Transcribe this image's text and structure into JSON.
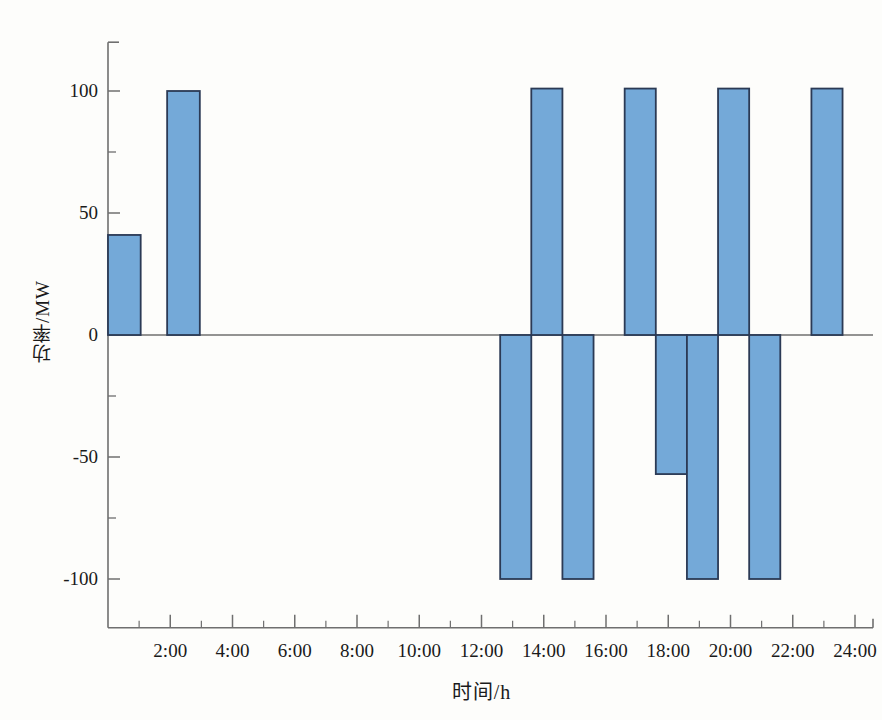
{
  "chart_data": {
    "type": "bar",
    "title": "",
    "xlabel": "时间/h",
    "ylabel": "功率/MW",
    "xlim": [
      0,
      24
    ],
    "ylim": [
      -120,
      120
    ],
    "grid": false,
    "legend": null,
    "x_tick_labels": [
      "2:00",
      "4:00",
      "6:00",
      "8:00",
      "10:00",
      "12:00",
      "14:00",
      "16:00",
      "18:00",
      "20:00",
      "22:00",
      "24:00"
    ],
    "x_tick_values": [
      2,
      4,
      6,
      8,
      10,
      12,
      14,
      16,
      18,
      20,
      22,
      24
    ],
    "x_minor_tick_step": 1,
    "y_tick_labels": [
      "100",
      "50",
      "0",
      "-50",
      "-100"
    ],
    "y_tick_values": [
      100,
      50,
      0,
      -50,
      -100
    ],
    "y_minor_tick_values": [
      75,
      25,
      -25,
      -75
    ],
    "bar_fill_color": "#74a9d8",
    "bar_edge_color": "#2b3a55",
    "axis_color": "#6f6f6f",
    "bars": [
      {
        "label": "0:00-1:00",
        "x_start": 0,
        "x_end": 1.05,
        "value": 41
      },
      {
        "label": "2:00-3:00",
        "x_start": 1.9,
        "x_end": 2.95,
        "value": 100
      },
      {
        "label": "13:00-14:00",
        "x_start": 12.6,
        "x_end": 13.6,
        "value": -100
      },
      {
        "label": "14:00-15:00",
        "x_start": 13.6,
        "x_end": 14.6,
        "value": 101
      },
      {
        "label": "15:00-16:00",
        "x_start": 14.6,
        "x_end": 15.6,
        "value": -100
      },
      {
        "label": "17:00-18:00",
        "x_start": 16.6,
        "x_end": 17.6,
        "value": 101
      },
      {
        "label": "18:00-19:00",
        "x_start": 17.6,
        "x_end": 18.6,
        "value": -57
      },
      {
        "label": "19:00-20:00",
        "x_start": 18.6,
        "x_end": 19.6,
        "value": -100
      },
      {
        "label": "20:00-21:00",
        "x_start": 19.6,
        "x_end": 20.6,
        "value": 101
      },
      {
        "label": "21:00-22:00",
        "x_start": 20.6,
        "x_end": 21.6,
        "value": -100
      },
      {
        "label": "23:00-24:00",
        "x_start": 22.6,
        "x_end": 23.6,
        "value": 101
      }
    ]
  }
}
